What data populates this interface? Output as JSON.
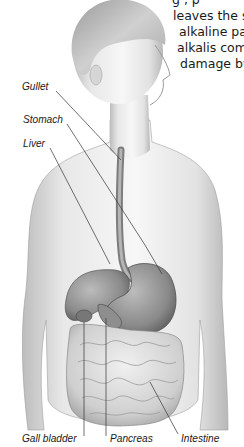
{
  "document": {
    "text_lines": [
      "g  ,  p",
      "leaves the s",
      "alkaline pa",
      "alkalis com",
      "damage by"
    ]
  },
  "figure": {
    "labels": {
      "gullet": "Gullet",
      "stomach": "Stomach",
      "liver": "Liver",
      "gall_bladder": "Gall bladder",
      "pancreas": "Pancreas",
      "intestine": "Intestine"
    }
  },
  "colors": {
    "text": "#1a1a1a",
    "skin_light": "#f2f2f2",
    "skin_shade": "#c8c8c8",
    "organ": "#8a8a8a",
    "leader_line": "#333333"
  }
}
